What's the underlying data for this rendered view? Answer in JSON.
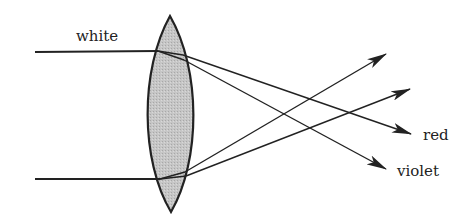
{
  "diagram": {
    "labels": {
      "incoming": "white",
      "red": "red",
      "violet": "violet"
    },
    "colors": {
      "ink": "#222222",
      "lens_fill": "#bdbdbd",
      "background": "#ffffff"
    },
    "lens": {
      "type": "biconvex",
      "top": [
        170,
        16
      ],
      "bottom": [
        171,
        212
      ],
      "left_x": 150,
      "right_x": 191
    },
    "rays": [
      {
        "name": "top-incoming",
        "from": [
          35,
          52
        ],
        "to": [
          158,
          51
        ]
      },
      {
        "name": "bottom-incoming",
        "from": [
          35,
          179
        ],
        "to": [
          160,
          179
        ]
      },
      {
        "name": "top-to-red",
        "from": [
          183,
          55
        ],
        "to": [
          411,
          134
        ]
      },
      {
        "name": "top-to-violet",
        "from": [
          184,
          60
        ],
        "to": [
          386,
          169
        ]
      },
      {
        "name": "bottom-upper",
        "from": [
          185,
          172
        ],
        "to": [
          386,
          54
        ]
      },
      {
        "name": "bottom-lower",
        "from": [
          186,
          176
        ],
        "to": [
          410,
          89
        ]
      }
    ]
  }
}
